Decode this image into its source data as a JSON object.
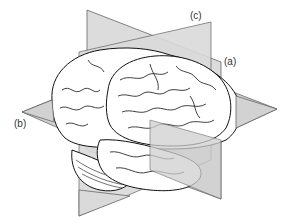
{
  "figure": {
    "labels": {
      "a": "(a)",
      "b": "(b)",
      "c": "(c)"
    },
    "colors": {
      "plane_fill": "#d6d6d6",
      "plane_stroke": "#555555",
      "brain_fill": "#ffffff",
      "brain_stroke": "#111111"
    }
  }
}
